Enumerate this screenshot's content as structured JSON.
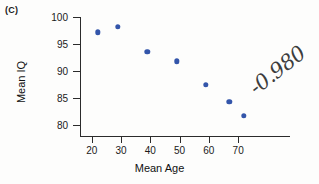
{
  "panel": {
    "label": "(C)"
  },
  "chart_data": {
    "type": "scatter",
    "title": "",
    "xlabel": "Mean Age",
    "ylabel": "Mean IQ",
    "xlim": [
      16,
      87.7
    ],
    "ylim": [
      78,
      100
    ],
    "grid": false,
    "legend": "none",
    "xticks": [
      20,
      30,
      40,
      50,
      60,
      70
    ],
    "yticks": [
      80,
      85,
      90,
      95,
      100
    ],
    "xtick_labels": [
      "20",
      "30",
      "40",
      "50",
      "60",
      "70"
    ],
    "ytick_labels": [
      "80",
      "85",
      "90",
      "95",
      "100"
    ],
    "point_color": "#3355aa",
    "series": [
      {
        "name": "Mean IQ by Mean Age",
        "points": [
          {
            "x": 22.0,
            "y": 97.2
          },
          {
            "x": 29.0,
            "y": 98.2
          },
          {
            "x": 39.0,
            "y": 93.6
          },
          {
            "x": 49.0,
            "y": 91.8
          },
          {
            "x": 59.0,
            "y": 87.5
          },
          {
            "x": 67.0,
            "y": 84.3
          },
          {
            "x": 72.0,
            "y": 81.7
          }
        ]
      }
    ],
    "annotations": [
      {
        "name": "correlation-annotation",
        "text": "-0.980",
        "handwritten": true,
        "rotation_deg": -38,
        "color": "#3d3d3d"
      }
    ]
  }
}
